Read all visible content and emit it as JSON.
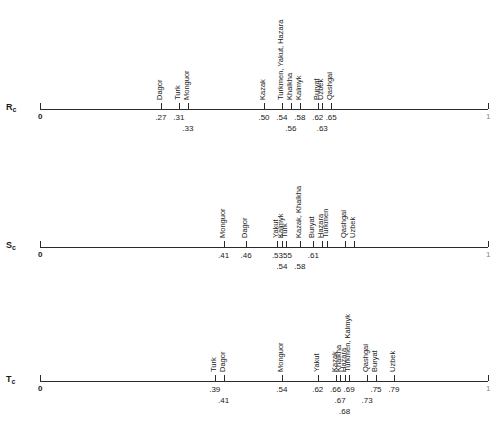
{
  "axis": {
    "min_label": "0",
    "max_label": "1",
    "x0": 40,
    "x1": 488
  },
  "rows": [
    {
      "label": "R",
      "subscript": "c",
      "line_y": 109,
      "markers": [
        {
          "value": 0.27,
          "label": ".27",
          "names": "Dagor",
          "val_row": 0
        },
        {
          "value": 0.31,
          "label": ".31",
          "names": "Turk",
          "val_row": 0
        },
        {
          "value": 0.33,
          "label": ".33",
          "names": "Monguor",
          "val_row": 1
        },
        {
          "value": 0.5,
          "label": ".50",
          "names": "Kazak",
          "val_row": 0
        },
        {
          "value": 0.54,
          "label": ".54",
          "names": "Turkmen, Yakut, Hazara",
          "val_row": 0
        },
        {
          "value": 0.56,
          "label": ".56",
          "names": "Khalkha",
          "val_row": 1
        },
        {
          "value": 0.58,
          "label": ".58",
          "names": "Kalmyk",
          "val_row": 0
        },
        {
          "value": 0.62,
          "label": ".62",
          "names": "Buryat",
          "val_row": 0
        },
        {
          "value": 0.63,
          "label": ".63",
          "names": "Uzbek",
          "val_row": 1
        },
        {
          "value": 0.65,
          "label": ".65",
          "names": "Qashgai",
          "val_row": 0
        }
      ]
    },
    {
      "label": "S",
      "subscript": "c",
      "line_y": 247,
      "markers": [
        {
          "value": 0.41,
          "label": ".41",
          "names": "Monguor",
          "val_row": 0
        },
        {
          "value": 0.46,
          "label": ".46",
          "names": "Dagor",
          "val_row": 0
        },
        {
          "value": 0.53,
          "label": ".53",
          "names": "Yakut",
          "val_row": 0
        },
        {
          "value": 0.54,
          "label": ".54",
          "names": "Kalmyk",
          "val_row": 1
        },
        {
          "value": 0.55,
          "label": ".55",
          "names": "Turk",
          "val_row": 0
        },
        {
          "value": 0.58,
          "label": ".58",
          "names": "Kazak, Khalkha",
          "val_row": 1
        },
        {
          "value": 0.61,
          "label": ".61",
          "names": "Buryat",
          "val_row": 0
        },
        {
          "value": 0.63,
          "label": "",
          "names": "Hazara",
          "val_row": 0
        },
        {
          "value": 0.64,
          "label": "",
          "names": "Turkmen",
          "val_row": 0
        },
        {
          "value": 0.68,
          "label": "",
          "names": "Qashgai",
          "val_row": 0
        },
        {
          "value": 0.7,
          "label": "",
          "names": "Uzbek",
          "val_row": 0
        }
      ]
    },
    {
      "label": "T",
      "subscript": "c",
      "line_y": 381,
      "markers": [
        {
          "value": 0.39,
          "label": ".39",
          "names": "Turk",
          "val_row": 0
        },
        {
          "value": 0.41,
          "label": ".41",
          "names": "Dagor",
          "val_row": 1
        },
        {
          "value": 0.54,
          "label": ".54",
          "names": "Monguor",
          "val_row": 0
        },
        {
          "value": 0.62,
          "label": ".62",
          "names": "Yakut",
          "val_row": 0
        },
        {
          "value": 0.66,
          "label": ".66",
          "names": "Kazak",
          "val_row": 0
        },
        {
          "value": 0.67,
          "label": ".67",
          "names": "Khalkha",
          "val_row": 1
        },
        {
          "value": 0.68,
          "label": ".68",
          "names": "Hazara",
          "val_row": 2
        },
        {
          "value": 0.69,
          "label": ".69",
          "names": "Turkmen, Kalmyk",
          "val_row": 0
        },
        {
          "value": 0.73,
          "label": ".73",
          "names": "Qashgai",
          "val_row": 1
        },
        {
          "value": 0.75,
          "label": ".75",
          "names": "Buryat",
          "val_row": 0
        },
        {
          "value": 0.79,
          "label": ".79",
          "names": "Uzbek",
          "val_row": 0
        }
      ]
    }
  ]
}
